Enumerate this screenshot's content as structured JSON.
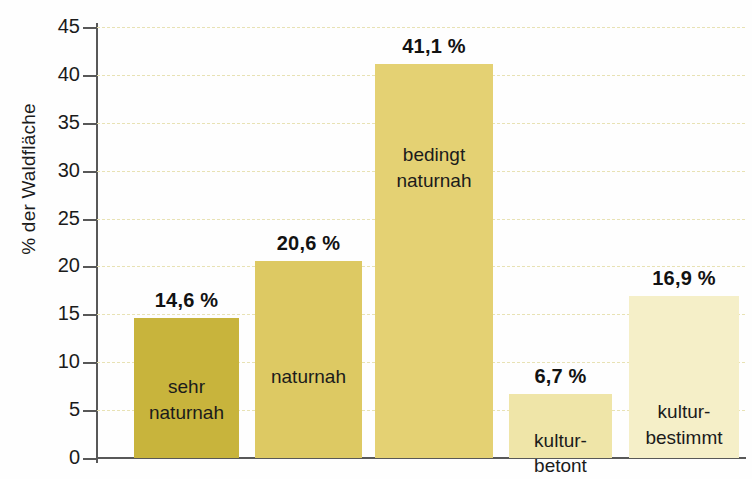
{
  "chart_data": {
    "type": "bar",
    "title": "",
    "subtitle": "",
    "xlabel": "",
    "ylabel": "% der Waldfläche",
    "ylim": [
      0,
      45
    ],
    "grid": true,
    "legend": "none",
    "categories": [
      "sehr naturnah",
      "naturnah",
      "bedingt naturnah",
      "kultur-betont",
      "kultur-bestimmt"
    ],
    "category_lines": [
      [
        "sehr",
        "naturnah"
      ],
      [
        "naturnah"
      ],
      [
        "bedingt",
        "naturnah"
      ],
      [
        "kultur-",
        "betont"
      ],
      [
        "kultur-",
        "bestimmt"
      ]
    ],
    "values": [
      14.6,
      20.6,
      41.1,
      6.7,
      16.9
    ],
    "value_labels": [
      "14,6 %",
      "20,6 %",
      "41,1 %",
      "6,7 %",
      "16,9 %"
    ],
    "bar_colors": [
      "#c8b43c",
      "#ddc963",
      "#e4d173",
      "#efe5a8",
      "#f5efc8"
    ],
    "y_ticks": [
      0,
      5,
      10,
      15,
      20,
      25,
      30,
      35,
      40,
      45
    ],
    "y_tick_labels": [
      "0",
      "5",
      "10",
      "15",
      "20",
      "25",
      "30",
      "35",
      "40",
      "45"
    ]
  },
  "axis": {
    "y_title": "% der Waldfläche",
    "axis_color": "#585858",
    "grid_color": "#e8e2b4"
  }
}
